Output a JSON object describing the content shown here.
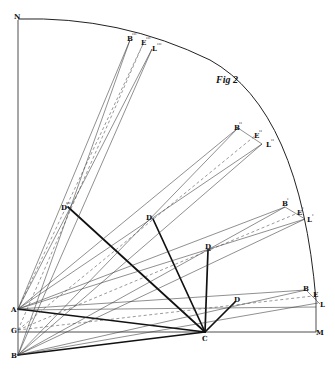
{
  "figure": {
    "title": "Fig 2"
  },
  "labels": {
    "N": "N",
    "A": "A",
    "G": "G",
    "B": "B",
    "C": "C",
    "M": "M",
    "D1": "D",
    "D2": "D",
    "D3": "D",
    "D4": "D",
    "D4_sup": "'''",
    "B1": "B",
    "E1": "E",
    "L1": "L",
    "B2": "B",
    "B2_sup": "'",
    "E2": "E",
    "E2_sup": "'",
    "L2": "L",
    "L2_sup": "'",
    "B3": "B",
    "B3_sup": "''",
    "E3": "E",
    "E3_sup": "''",
    "L3": "L",
    "L3_sup": "''",
    "B4": "B",
    "B4_sup": "'''",
    "E4": "E",
    "E4_sup": "'''",
    "L4": "L",
    "L4_sup": "'''"
  },
  "colors": {
    "ink": "#111111",
    "paper": "#ffffff"
  }
}
